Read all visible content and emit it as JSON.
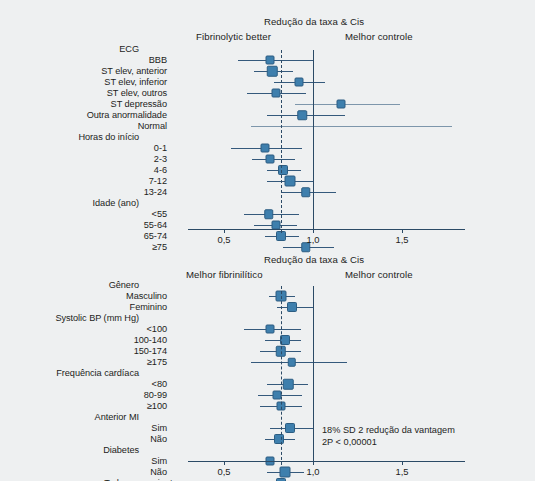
{
  "figure": {
    "background_color": "#eef0f1",
    "marker_color": "#3e7fad",
    "line_color": "#34597c",
    "axis_color": "#2b4a66"
  },
  "chart_data": {
    "type": "forest",
    "title": "Redução da taxa & Cis",
    "xlabel": "Redução da taxa & Cis",
    "ylabel": "",
    "xlim": [
      0.33,
      1.78
    ],
    "xticks": [
      0.5,
      1.0,
      1.5
    ],
    "xtick_labels": [
      "0,5",
      "1,0",
      "1,5"
    ],
    "reference_line": 1.0,
    "pooled_line": 0.82,
    "grid": false,
    "panels": [
      {
        "id": "top",
        "title": "Redução da taxa & Cis",
        "left_header": "Fibrinolytic better",
        "right_header": "Melhor controle",
        "axis_label": "Redução da taxa & Cis",
        "groups": [
          {
            "name": "ECG",
            "rows": [
              {
                "label": "BBB",
                "value": 0.76,
                "ci_low": 0.58,
                "ci_high": 1.0,
                "size": 7,
                "pale": false
              },
              {
                "label": "ST elev, anterior",
                "value": 0.77,
                "ci_low": 0.67,
                "ci_high": 0.89,
                "size": 8.5,
                "pale": false
              },
              {
                "label": "ST elev, inferior",
                "value": 0.92,
                "ci_low": 0.78,
                "ci_high": 1.07,
                "size": 7,
                "pale": false
              },
              {
                "label": "ST elev, outros",
                "value": 0.79,
                "ci_low": 0.63,
                "ci_high": 0.96,
                "size": 7,
                "pale": false
              },
              {
                "label": "ST depressão",
                "value": 1.16,
                "ci_low": 0.9,
                "ci_high": 1.49,
                "size": 7,
                "pale": true
              },
              {
                "label": "Outra anormalidade",
                "value": 0.94,
                "ci_low": 0.74,
                "ci_high": 1.18,
                "size": 7.5,
                "pale": false
              },
              {
                "label": "Normal",
                "value": null,
                "ci_low": 0.65,
                "ci_high": 1.78,
                "size": 0,
                "pale": true
              }
            ]
          },
          {
            "name": "Horas do início",
            "rows": [
              {
                "label": "0-1",
                "value": 0.73,
                "ci_low": 0.54,
                "ci_high": 0.94,
                "size": 7,
                "pale": false
              },
              {
                "label": "2-3",
                "value": 0.76,
                "ci_low": 0.66,
                "ci_high": 0.9,
                "size": 7,
                "pale": false
              },
              {
                "label": "4-6",
                "value": 0.83,
                "ci_low": 0.74,
                "ci_high": 0.93,
                "size": 8,
                "pale": false
              },
              {
                "label": "7-12",
                "value": 0.87,
                "ci_low": 0.74,
                "ci_high": 1.0,
                "size": 9,
                "pale": false
              },
              {
                "label": "13-24",
                "value": 0.96,
                "ci_low": 0.82,
                "ci_high": 1.13,
                "size": 7.5,
                "pale": false
              }
            ]
          },
          {
            "name": "Idade (ano)",
            "rows": [
              {
                "label": "<55",
                "value": 0.75,
                "ci_low": 0.61,
                "ci_high": 0.92,
                "size": 7.5,
                "pale": false
              },
              {
                "label": "55-64",
                "value": 0.79,
                "ci_low": 0.67,
                "ci_high": 0.91,
                "size": 7,
                "pale": false
              },
              {
                "label": "65-74",
                "value": 0.82,
                "ci_low": 0.73,
                "ci_high": 0.92,
                "size": 8,
                "pale": false
              },
              {
                "label": "≥75",
                "value": 0.96,
                "ci_low": 0.83,
                "ci_high": 1.12,
                "size": 7.5,
                "pale": false
              }
            ]
          }
        ]
      },
      {
        "id": "bottom",
        "title": "Redução da taxa & Cis",
        "left_header": "Melhor fibrinilítico",
        "right_header": "Melhor controle",
        "axis_label": "",
        "annotation_line1": "18% SD 2 redução da vantagem",
        "annotation_line2": "2P < 0,00001",
        "groups": [
          {
            "name": "Gênero",
            "rows": [
              {
                "label": "Masculino",
                "value": 0.82,
                "ci_low": 0.75,
                "ci_high": 0.9,
                "size": 9,
                "pale": false
              },
              {
                "label": "Feminino",
                "value": 0.88,
                "ci_low": 0.8,
                "ci_high": 1.0,
                "size": 8,
                "pale": false
              }
            ]
          },
          {
            "name": "Systolic BP (mm Hg)",
            "rows": [
              {
                "label": "<100",
                "value": 0.76,
                "ci_low": 0.61,
                "ci_high": 0.93,
                "size": 7,
                "pale": false
              },
              {
                "label": "100-140",
                "value": 0.84,
                "ci_low": 0.73,
                "ci_high": 0.93,
                "size": 8,
                "pale": false
              },
              {
                "label": "150-174",
                "value": 0.82,
                "ci_low": 0.7,
                "ci_high": 0.93,
                "size": 8.5,
                "pale": false
              },
              {
                "label": "≥175",
                "value": 0.88,
                "ci_low": 0.65,
                "ci_high": 1.19,
                "size": 6.5,
                "pale": false
              }
            ]
          },
          {
            "name": "Frequência cardíaca",
            "rows": [
              {
                "label": "<80",
                "value": 0.86,
                "ci_low": 0.74,
                "ci_high": 0.97,
                "size": 8.5,
                "pale": false
              },
              {
                "label": "80-99",
                "value": 0.8,
                "ci_low": 0.69,
                "ci_high": 0.94,
                "size": 7,
                "pale": false
              },
              {
                "label": "≥100",
                "value": 0.82,
                "ci_low": 0.7,
                "ci_high": 0.94,
                "size": 7,
                "pale": false
              }
            ]
          },
          {
            "name": "Anterior MI",
            "rows": [
              {
                "label": "Sim",
                "value": 0.87,
                "ci_low": 0.76,
                "ci_high": 1.0,
                "size": 8,
                "pale": false
              },
              {
                "label": "Não",
                "value": 0.81,
                "ci_low": 0.73,
                "ci_high": 0.9,
                "size": 8,
                "pale": false
              }
            ]
          },
          {
            "name": "Diabetes",
            "rows": [
              {
                "label": "Sim",
                "value": 0.76,
                "ci_low": 0.62,
                "ci_high": 0.93,
                "size": 7,
                "pale": false
              },
              {
                "label": "Não",
                "value": 0.84,
                "ci_low": 0.74,
                "ci_high": 0.95,
                "size": 9,
                "pale": false
              }
            ]
          },
          {
            "name": "",
            "rows": [
              {
                "label": "Todos os pacientes",
                "value": 0.82,
                "ci_low": 0.79,
                "ci_high": 0.86,
                "size": 8,
                "pale": false,
                "total": true
              }
            ]
          }
        ]
      }
    ]
  }
}
